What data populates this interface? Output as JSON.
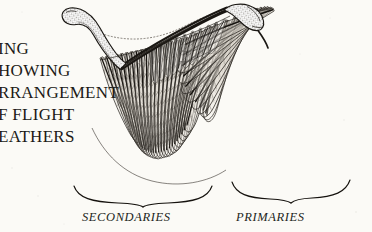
{
  "plate": {
    "background_color": "#fbfaf6",
    "ink_color": "#1c1a17",
    "subject": "bird-wing-skeleton-and-flight-feathers"
  },
  "caption": {
    "note": "caption is cropped by the left edge of the image; only partial words are visible",
    "lines": [
      {
        "id": "line1",
        "text": "ING"
      },
      {
        "id": "line2",
        "text": "HOWING"
      },
      {
        "id": "line3",
        "text": "RRANGEMENT"
      },
      {
        "id": "line4",
        "text": "F FLIGHT"
      },
      {
        "id": "line5",
        "text": "EATHERS"
      }
    ]
  },
  "feather_groups": [
    {
      "id": "secondaries",
      "label": "SECONDARIES"
    },
    {
      "id": "primaries",
      "label": "PRIMARIES"
    }
  ],
  "illustration_parts": {
    "humerus": "humerus-bone",
    "radius_ulna": "radius-ulna-bone",
    "wrist": "wrist-carpal-bones",
    "leading_edge": "dotted-patagium-outline",
    "secondary_feathers_count": 24,
    "primary_feathers_count": 11
  }
}
